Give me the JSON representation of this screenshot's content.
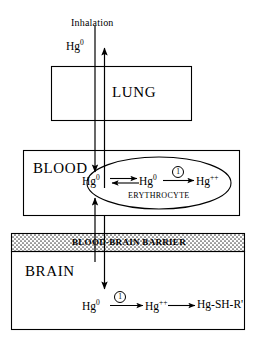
{
  "diagram": {
    "title_label": "Inhalation",
    "inhaled_species": "Hg",
    "inhaled_charge": "0",
    "compartments": {
      "lung": "LUNG",
      "blood": "BLOOD",
      "brain": "BRAIN",
      "barrier": "BLOOD-BRAIN BARRIER"
    },
    "blood": {
      "plasma_species": "Hg",
      "plasma_charge": "0",
      "rbc_species": "Hg",
      "rbc_charge": "0",
      "rbc_product": "Hg",
      "rbc_product_charge": "++",
      "enzyme_marker": "1",
      "cell_label": "ERYTHROCYTE"
    },
    "brain": {
      "species_1": "Hg",
      "species_1_charge": "0",
      "enzyme_marker": "1",
      "species_2": "Hg",
      "species_2_charge": "++",
      "species_3": "Hg-SH-R'"
    },
    "colors": {
      "stroke": "#000000",
      "background": "#ffffff",
      "barrier_fill": "#e8e8e8"
    }
  }
}
